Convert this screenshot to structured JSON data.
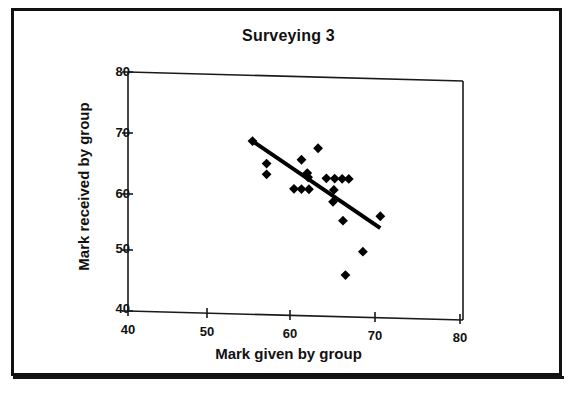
{
  "figure": {
    "border_color": "#111111",
    "background": "#ffffff"
  },
  "chart_data": {
    "type": "scatter",
    "title": "Surveying 3",
    "xlabel": "Mark given by group",
    "ylabel": "Mark received by group",
    "xlim": [
      40,
      80
    ],
    "ylim": [
      40,
      80
    ],
    "xticks": [
      40,
      50,
      60,
      70,
      80
    ],
    "yticks": [
      40,
      50,
      60,
      70,
      80
    ],
    "grid": false,
    "legend": null,
    "marker": {
      "shape": "diamond",
      "color": "#000000",
      "size": 7
    },
    "points": [
      {
        "x": 55.0,
        "y": 69.0
      },
      {
        "x": 56.7,
        "y": 65.3
      },
      {
        "x": 56.7,
        "y": 63.5
      },
      {
        "x": 60.0,
        "y": 61.2
      },
      {
        "x": 60.9,
        "y": 61.2
      },
      {
        "x": 61.8,
        "y": 61.2
      },
      {
        "x": 60.9,
        "y": 66.1
      },
      {
        "x": 61.6,
        "y": 63.9
      },
      {
        "x": 61.7,
        "y": 63.2
      },
      {
        "x": 62.9,
        "y": 68.1
      },
      {
        "x": 63.9,
        "y": 63.1
      },
      {
        "x": 64.9,
        "y": 63.1
      },
      {
        "x": 65.8,
        "y": 63.1
      },
      {
        "x": 66.6,
        "y": 63.1
      },
      {
        "x": 64.8,
        "y": 61.2
      },
      {
        "x": 64.7,
        "y": 59.2
      },
      {
        "x": 65.9,
        "y": 56.1
      },
      {
        "x": 70.4,
        "y": 57.0
      },
      {
        "x": 68.3,
        "y": 51.0
      },
      {
        "x": 66.2,
        "y": 47.0
      }
    ],
    "trendline": {
      "type": "linear",
      "color": "#000000",
      "width": 4,
      "x_start": 55.0,
      "y_start": 69.0,
      "x_end": 70.4,
      "y_end": 55.0
    }
  },
  "axis": {
    "line_color": "#1a1a1a",
    "y_tick_labels": [
      "80",
      "70",
      "60",
      "50",
      "40"
    ],
    "x_tick_labels": [
      "40",
      "50",
      "60",
      "70",
      "80"
    ]
  }
}
